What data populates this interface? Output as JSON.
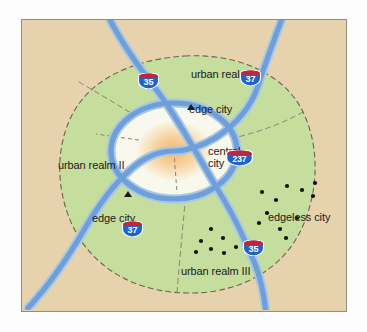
{
  "figure": {
    "kind": "conceptual-urban-map",
    "background_color": "#ffffff",
    "frame_border_color": "#8e8e86",
    "land_color": "#e6d3ad",
    "urbanized_color": "#c5dd9d",
    "core_color": "#f6f4e6",
    "central_city_color": "#f3b96b",
    "highway_color": "#6f9fd8",
    "highway_casing_color": "#a8c6e8",
    "boundary_dash_color": "#6b6350",
    "divider_dash_color": "#8a8472",
    "dot_color": "#111111",
    "label_color": "#1b1b1b"
  },
  "labels": {
    "urban_realm_1": "urban realm I",
    "urban_realm_2": "urban realm II",
    "urban_realm_3": "urban realm III",
    "central_city_line1": "central",
    "central_city_line2": "city",
    "edge_city_north": "edge city",
    "edge_city_west": "edge city",
    "edgeless_city": "edgeless city"
  },
  "shields": [
    {
      "name": "interstate-35-north",
      "number": "35",
      "x": 138,
      "y": 73,
      "width": 21,
      "height": 16
    },
    {
      "name": "interstate-37-northeast",
      "number": "37",
      "x": 240,
      "y": 70,
      "width": 21,
      "height": 16
    },
    {
      "name": "interstate-237-central",
      "number": "237",
      "x": 226,
      "y": 150,
      "width": 27,
      "height": 16
    },
    {
      "name": "interstate-37-southwest",
      "number": "37",
      "x": 122,
      "y": 221,
      "width": 21,
      "height": 16
    },
    {
      "name": "interstate-35-south",
      "number": "35",
      "x": 243,
      "y": 240,
      "width": 21,
      "height": 16
    }
  ],
  "edge_city_markers": [
    {
      "name": "edge-city-marker-north",
      "x": 187,
      "y": 104
    },
    {
      "name": "edge-city-marker-west",
      "x": 124,
      "y": 191
    }
  ],
  "edgeless_city_dots": [
    {
      "x": 287,
      "y": 186
    },
    {
      "x": 315,
      "y": 183
    },
    {
      "x": 262,
      "y": 192
    },
    {
      "x": 302,
      "y": 190
    },
    {
      "x": 276,
      "y": 200
    },
    {
      "x": 313,
      "y": 196
    },
    {
      "x": 267,
      "y": 213
    },
    {
      "x": 297,
      "y": 218
    },
    {
      "x": 259,
      "y": 223
    },
    {
      "x": 280,
      "y": 229
    },
    {
      "x": 286,
      "y": 238
    },
    {
      "x": 252,
      "y": 244
    }
  ],
  "urban_realm_3_dots": [
    {
      "x": 211,
      "y": 229
    },
    {
      "x": 201,
      "y": 241
    },
    {
      "x": 223,
      "y": 238
    },
    {
      "x": 236,
      "y": 247
    },
    {
      "x": 211,
      "y": 249
    },
    {
      "x": 224,
      "y": 253
    },
    {
      "x": 196,
      "y": 252
    }
  ]
}
